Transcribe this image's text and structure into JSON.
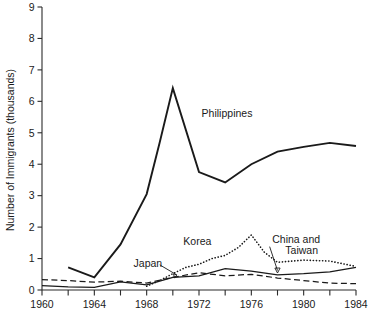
{
  "chart_data": {
    "type": "line",
    "title": "",
    "xlabel": "",
    "ylabel": "Number of Immigrants (thousands)",
    "xlim": [
      1960,
      1984
    ],
    "ylim": [
      0,
      9
    ],
    "grid": false,
    "legend_position": "inline-annotations",
    "xticks": [
      1960,
      1964,
      1968,
      1972,
      1976,
      1980,
      1984
    ],
    "xticks_minor": [
      1962,
      1966,
      1970,
      1974,
      1978,
      1982
    ],
    "yticks": [
      0,
      1,
      2,
      3,
      4,
      5,
      6,
      7,
      8,
      9
    ],
    "xtick_labels": [
      "1960",
      "1964",
      "1968",
      "1972",
      "1976",
      "1980",
      "1984"
    ],
    "ytick_labels": [
      "0",
      "1",
      "2",
      "3",
      "4",
      "5",
      "6",
      "7",
      "8",
      "9"
    ],
    "series": [
      {
        "name": "Philippines",
        "style": "solid-thick",
        "x": [
          1962,
          1964,
          1966,
          1968,
          1969,
          1970,
          1972,
          1974,
          1976,
          1978,
          1980,
          1982,
          1984
        ],
        "values": [
          0.72,
          0.4,
          1.45,
          3.05,
          4.7,
          6.42,
          3.75,
          3.42,
          4.0,
          4.4,
          4.55,
          4.68,
          4.58
        ]
      },
      {
        "name": "Korea",
        "style": "dotted",
        "x": [
          1968,
          1969,
          1970,
          1971,
          1972,
          1973,
          1974,
          1975,
          1976,
          1977,
          1978,
          1980,
          1982,
          1984
        ],
        "values": [
          0.12,
          0.3,
          0.52,
          0.72,
          0.82,
          1.0,
          1.1,
          1.35,
          1.75,
          1.2,
          0.88,
          0.95,
          0.92,
          0.75
        ]
      },
      {
        "name": "Japan",
        "style": "dashed",
        "x": [
          1960,
          1962,
          1964,
          1966,
          1968,
          1970,
          1972,
          1974,
          1976,
          1978,
          1980,
          1982,
          1984
        ],
        "values": [
          0.33,
          0.3,
          0.25,
          0.28,
          0.22,
          0.4,
          0.55,
          0.45,
          0.5,
          0.38,
          0.3,
          0.22,
          0.2
        ]
      },
      {
        "name": "China and Taiwan",
        "style": "solid-thin",
        "x": [
          1960,
          1962,
          1964,
          1966,
          1968,
          1970,
          1972,
          1974,
          1976,
          1978,
          1980,
          1982,
          1984
        ],
        "values": [
          0.14,
          0.1,
          0.08,
          0.26,
          0.16,
          0.4,
          0.45,
          0.68,
          0.6,
          0.48,
          0.52,
          0.58,
          0.72
        ]
      }
    ],
    "annotations": [
      {
        "name": "philippines",
        "text": "Philippines",
        "x": 1972.2,
        "y": 5.62,
        "leader": false
      },
      {
        "name": "korea",
        "text": "Korea",
        "x": 1970.8,
        "y": 1.55,
        "leader": false
      },
      {
        "name": "japan",
        "text": "Japan",
        "x": 1967.0,
        "y": 0.85,
        "leader": true
      },
      {
        "name": "china-and-taiwan",
        "text": "China and",
        "x": 1977.6,
        "y": 1.6,
        "leader": true
      },
      {
        "name": "china-and-taiwan-line2",
        "text": "Taiwan",
        "x": 1978.6,
        "y": 1.25,
        "leader": false
      }
    ]
  }
}
